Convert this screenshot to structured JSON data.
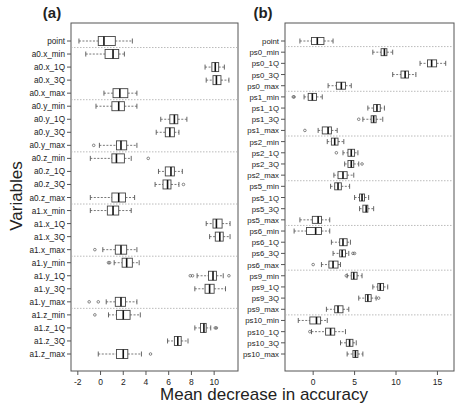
{
  "chart_data": [
    {
      "panel": "(a)",
      "type": "boxplot",
      "orientation": "horizontal",
      "title": "(a)",
      "xlabel": "Mean decrease in accuracy",
      "ylabel": "Variables",
      "xticks": [
        -2,
        0,
        2,
        4,
        6,
        8,
        10
      ],
      "xlim": [
        -2.6,
        12.1
      ],
      "grid": false,
      "separators_after": [
        "point",
        "a0.x_max",
        "a0.y_max",
        "a0.z_max",
        "a1.x_max",
        "a1.y_max"
      ],
      "series": [
        {
          "name": "point",
          "whisker_low": -1.9,
          "q1": -0.2,
          "median": 0.3,
          "q3": 1.3,
          "whisker_high": 2.8,
          "outliers": []
        },
        {
          "name": "a0.x_min",
          "whisker_low": -1.3,
          "q1": 0.4,
          "median": 1.1,
          "q3": 1.6,
          "whisker_high": 2.1,
          "outliers": []
        },
        {
          "name": "a0.x_1Q",
          "whisker_low": 9.2,
          "q1": 9.8,
          "median": 10.1,
          "q3": 10.4,
          "whisker_high": 10.9,
          "outliers": []
        },
        {
          "name": "a0.x_3Q",
          "whisker_low": 9.3,
          "q1": 9.9,
          "median": 10.2,
          "q3": 10.6,
          "whisker_high": 11.3,
          "outliers": []
        },
        {
          "name": "a0.x_max",
          "whisker_low": 0.3,
          "q1": 1.1,
          "median": 1.7,
          "q3": 2.4,
          "whisker_high": 3.2,
          "outliers": []
        },
        {
          "name": "a0.y_min",
          "whisker_low": -0.4,
          "q1": 1.0,
          "median": 1.6,
          "q3": 2.1,
          "whisker_high": 3.2,
          "outliers": []
        },
        {
          "name": "a0.y_1Q",
          "whisker_low": 5.3,
          "q1": 6.1,
          "median": 6.5,
          "q3": 6.8,
          "whisker_high": 7.6,
          "outliers": []
        },
        {
          "name": "a0.y_3Q",
          "whisker_low": 4.9,
          "q1": 5.7,
          "median": 6.1,
          "q3": 6.5,
          "whisker_high": 6.9,
          "outliers": []
        },
        {
          "name": "a0.y_max",
          "whisker_low": -0.1,
          "q1": 1.4,
          "median": 1.8,
          "q3": 2.3,
          "whisker_high": 3.2,
          "outliers": [
            -0.6
          ]
        },
        {
          "name": "a0.z_min",
          "whisker_low": -0.9,
          "q1": 1.0,
          "median": 1.4,
          "q3": 2.1,
          "whisker_high": 2.7,
          "outliers": [
            4.2
          ]
        },
        {
          "name": "a0.z_1Q",
          "whisker_low": 5.1,
          "q1": 5.7,
          "median": 6.2,
          "q3": 6.5,
          "whisker_high": 7.2,
          "outliers": []
        },
        {
          "name": "a0.z_3Q",
          "whisker_low": 4.8,
          "q1": 5.5,
          "median": 5.9,
          "q3": 6.2,
          "whisker_high": 6.9,
          "outliers": [
            7.3
          ]
        },
        {
          "name": "a0.z_max",
          "whisker_low": -0.9,
          "q1": 1.0,
          "median": 1.6,
          "q3": 2.2,
          "whisker_high": 3.0,
          "outliers": []
        },
        {
          "name": "a1.x_min",
          "whisker_low": -0.9,
          "q1": 0.6,
          "median": 1.1,
          "q3": 1.6,
          "whisker_high": 2.7,
          "outliers": []
        },
        {
          "name": "a1.x_1Q",
          "whisker_low": 9.3,
          "q1": 9.9,
          "median": 10.2,
          "q3": 10.7,
          "whisker_high": 11.4,
          "outliers": []
        },
        {
          "name": "a1.x_3Q",
          "whisker_low": 9.6,
          "q1": 10.1,
          "median": 10.5,
          "q3": 10.8,
          "whisker_high": 11.4,
          "outliers": []
        },
        {
          "name": "a1.x_max",
          "whisker_low": 0.2,
          "q1": 1.3,
          "median": 1.8,
          "q3": 2.3,
          "whisker_high": 3.2,
          "outliers": [
            -0.5
          ]
        },
        {
          "name": "a1.y_min",
          "whisker_low": 1.2,
          "q1": 1.9,
          "median": 2.3,
          "q3": 2.8,
          "whisker_high": 3.4,
          "outliers": [
            0.7,
            0.8
          ]
        },
        {
          "name": "a1.y_1Q",
          "whisker_low": 8.5,
          "q1": 9.5,
          "median": 9.9,
          "q3": 10.2,
          "whisker_high": 10.8,
          "outliers": [
            7.9,
            8.1,
            11.3
          ]
        },
        {
          "name": "a1.y_3Q",
          "whisker_low": 8.3,
          "q1": 9.2,
          "median": 9.6,
          "q3": 10.0,
          "whisker_high": 11.0,
          "outliers": []
        },
        {
          "name": "a1.y_max",
          "whisker_low": 0.5,
          "q1": 1.3,
          "median": 1.8,
          "q3": 2.2,
          "whisker_high": 3.2,
          "outliers": [
            -1.0,
            -0.2
          ]
        },
        {
          "name": "a1.z_min",
          "whisker_low": 0.7,
          "q1": 1.4,
          "median": 2.0,
          "q3": 2.6,
          "whisker_high": 3.5,
          "outliers": [
            -0.5
          ]
        },
        {
          "name": "a1.z_1Q",
          "whisker_low": 8.3,
          "q1": 8.8,
          "median": 9.1,
          "q3": 9.3,
          "whisker_high": 9.7,
          "outliers": [
            10.1,
            10.2
          ]
        },
        {
          "name": "a1.z_3Q",
          "whisker_low": 5.9,
          "q1": 6.5,
          "median": 6.8,
          "q3": 7.1,
          "whisker_high": 7.7,
          "outliers": []
        },
        {
          "name": "a1.z_max",
          "whisker_low": -0.2,
          "q1": 1.4,
          "median": 2.0,
          "q3": 2.4,
          "whisker_high": 3.6,
          "outliers": [
            4.4
          ]
        }
      ]
    },
    {
      "panel": "(b)",
      "type": "boxplot",
      "orientation": "horizontal",
      "title": "(b)",
      "xlabel": "Mean decrease in accuracy",
      "ylabel": "Variables",
      "xticks": [
        0,
        5,
        10,
        15
      ],
      "xlim": [
        -3.4,
        17.0
      ],
      "grid": false,
      "separators_after": [
        "point",
        "ps0_max",
        "ps1_max",
        "ps2_max",
        "ps5_max",
        "ps6_max",
        "ps9_max"
      ],
      "series": [
        {
          "name": "point",
          "whisker_low": -1.6,
          "q1": -0.2,
          "median": 0.5,
          "q3": 1.3,
          "whisker_high": 2.4,
          "outliers": []
        },
        {
          "name": "ps0_min",
          "whisker_low": 7.2,
          "q1": 8.2,
          "median": 8.6,
          "q3": 8.9,
          "whisker_high": 9.6,
          "outliers": []
        },
        {
          "name": "ps0_1Q",
          "whisker_low": 12.9,
          "q1": 13.8,
          "median": 14.3,
          "q3": 14.9,
          "whisker_high": 16.0,
          "outliers": []
        },
        {
          "name": "ps0_3Q",
          "whisker_low": 9.6,
          "q1": 10.6,
          "median": 11.1,
          "q3": 11.5,
          "whisker_high": 12.4,
          "outliers": []
        },
        {
          "name": "ps0_max",
          "whisker_low": 1.8,
          "q1": 2.8,
          "median": 3.4,
          "q3": 3.9,
          "whisker_high": 4.6,
          "outliers": []
        },
        {
          "name": "ps1_min",
          "whisker_low": -1.1,
          "q1": -0.6,
          "median": -0.1,
          "q3": 0.4,
          "whisker_high": 1.1,
          "outliers": [
            -2.4,
            -2.3
          ]
        },
        {
          "name": "ps1_1Q",
          "whisker_low": 6.6,
          "q1": 7.3,
          "median": 7.7,
          "q3": 8.1,
          "whisker_high": 8.6,
          "outliers": []
        },
        {
          "name": "ps1_3Q",
          "whisker_low": 6.0,
          "q1": 7.0,
          "median": 7.3,
          "q3": 7.6,
          "whisker_high": 8.4,
          "outliers": [
            5.5
          ]
        },
        {
          "name": "ps1_max",
          "whisker_low": 0.6,
          "q1": 1.1,
          "median": 1.8,
          "q3": 2.2,
          "whisker_high": 2.9,
          "outliers": [
            -1.0
          ]
        },
        {
          "name": "ps2_min",
          "whisker_low": 1.7,
          "q1": 2.2,
          "median": 2.6,
          "q3": 3.0,
          "whisker_high": 3.7,
          "outliers": []
        },
        {
          "name": "ps2_1Q",
          "whisker_low": 3.6,
          "q1": 4.2,
          "median": 4.6,
          "q3": 5.0,
          "whisker_high": 5.4,
          "outliers": [
            2.8
          ]
        },
        {
          "name": "ps2_3Q",
          "whisker_low": 3.8,
          "q1": 4.2,
          "median": 4.6,
          "q3": 4.9,
          "whisker_high": 5.5,
          "outliers": [
            5.9
          ]
        },
        {
          "name": "ps2_max",
          "whisker_low": 2.5,
          "q1": 3.0,
          "median": 3.6,
          "q3": 4.1,
          "whisker_high": 4.9,
          "outliers": []
        },
        {
          "name": "ps5_min",
          "whisker_low": 2.1,
          "q1": 2.6,
          "median": 3.0,
          "q3": 3.4,
          "whisker_high": 4.4,
          "outliers": []
        },
        {
          "name": "ps5_1Q",
          "whisker_low": 5.0,
          "q1": 5.6,
          "median": 5.9,
          "q3": 6.2,
          "whisker_high": 6.7,
          "outliers": []
        },
        {
          "name": "ps5_3Q",
          "whisker_low": 5.6,
          "q1": 6.0,
          "median": 6.4,
          "q3": 6.6,
          "whisker_high": 7.3,
          "outliers": []
        },
        {
          "name": "ps5_max",
          "whisker_low": -1.6,
          "q1": -0.1,
          "median": 0.6,
          "q3": 1.0,
          "whisker_high": 2.0,
          "outliers": []
        },
        {
          "name": "ps6_min",
          "whisker_low": -2.3,
          "q1": -0.8,
          "median": 0.3,
          "q3": 1.0,
          "whisker_high": 2.0,
          "outliers": []
        },
        {
          "name": "ps6_1Q",
          "whisker_low": 2.2,
          "q1": 3.2,
          "median": 3.6,
          "q3": 4.1,
          "whisker_high": 4.5,
          "outliers": []
        },
        {
          "name": "ps6_3Q",
          "whisker_low": 2.4,
          "q1": 3.2,
          "median": 3.5,
          "q3": 3.9,
          "whisker_high": 4.3,
          "outliers": [
            4.8,
            5.0
          ]
        },
        {
          "name": "ps6_max",
          "whisker_low": 1.0,
          "q1": 1.9,
          "median": 2.4,
          "q3": 3.0,
          "whisker_high": 3.3,
          "outliers": [
            0.0
          ]
        },
        {
          "name": "ps9_min",
          "whisker_low": 4.1,
          "q1": 4.6,
          "median": 4.9,
          "q3": 5.3,
          "whisker_high": 5.9,
          "outliers": [
            4.0
          ]
        },
        {
          "name": "ps9_1Q",
          "whisker_low": 7.2,
          "q1": 7.8,
          "median": 8.1,
          "q3": 8.5,
          "whisker_high": 9.0,
          "outliers": []
        },
        {
          "name": "ps9_3Q",
          "whisker_low": 5.5,
          "q1": 6.3,
          "median": 6.6,
          "q3": 7.0,
          "whisker_high": 7.6,
          "outliers": [
            7.9
          ]
        },
        {
          "name": "ps9_max",
          "whisker_low": 1.6,
          "q1": 2.6,
          "median": 3.0,
          "q3": 3.6,
          "whisker_high": 4.3,
          "outliers": []
        },
        {
          "name": "ps10_min",
          "whisker_low": -1.8,
          "q1": -0.4,
          "median": 0.4,
          "q3": 0.9,
          "whisker_high": 1.7,
          "outliers": []
        },
        {
          "name": "ps10_1Q",
          "whisker_low": -0.2,
          "q1": 1.5,
          "median": 2.1,
          "q3": 2.6,
          "whisker_high": 3.9,
          "outliers": [
            -0.4
          ]
        },
        {
          "name": "ps10_3Q",
          "whisker_low": 3.3,
          "q1": 4.0,
          "median": 4.4,
          "q3": 4.8,
          "whisker_high": 5.2,
          "outliers": []
        },
        {
          "name": "ps10_max",
          "whisker_low": 4.1,
          "q1": 4.8,
          "median": 5.1,
          "q3": 5.4,
          "whisker_high": 6.0,
          "outliers": []
        }
      ]
    }
  ],
  "figure": {
    "xlabel": "Mean decrease in accuracy",
    "ylabel": "Variables",
    "panel_a_title": "(a)",
    "panel_b_title": "(b)",
    "colors": {
      "box_stroke": "#444444",
      "whisker": "#555555",
      "separator": "#aaaaaa",
      "frame": "#555555",
      "text": "#222222"
    }
  }
}
